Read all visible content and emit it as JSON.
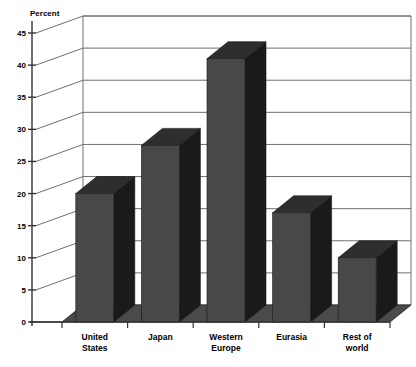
{
  "chart_data": {
    "type": "bar",
    "title": "",
    "subtitle": "",
    "xlabel": "",
    "ylabel": "Percent",
    "ylim": [
      0,
      45
    ],
    "ytick_step": 5,
    "yticks": [
      0,
      5,
      10,
      15,
      20,
      25,
      30,
      35,
      40,
      45
    ],
    "ytick_labels": [
      "0",
      "5",
      "10",
      "15",
      "20",
      "25",
      "30",
      "35",
      "40",
      "45"
    ],
    "grid": true,
    "grid_axis": "y",
    "legend": null,
    "legend_position": "none",
    "style": "3d-bar",
    "categories": [
      "United States",
      "Japan",
      "Western Europe",
      "Eurasia",
      "Rest of world"
    ],
    "category_lines": [
      [
        "United",
        "States"
      ],
      [
        "Japan"
      ],
      [
        "Western",
        "Europe"
      ],
      [
        "Eurasia"
      ],
      [
        "Rest of",
        "world"
      ]
    ],
    "values": [
      20,
      27.5,
      41,
      17,
      10
    ],
    "series": [
      {
        "name": "Percent",
        "values": [
          20,
          27.5,
          41,
          17,
          10
        ]
      }
    ],
    "annotations": []
  },
  "colors": {
    "bar_front": "#484848",
    "bar_side": "#1a1a1a",
    "bar_top": "#2e2e2e",
    "floor": "#4a4a4a",
    "axis": "#333333",
    "gridline": "#707070",
    "wall": "#ffffff",
    "text": "#000000",
    "background": "#ffffff"
  },
  "axis": {
    "y_title": "Percent"
  }
}
